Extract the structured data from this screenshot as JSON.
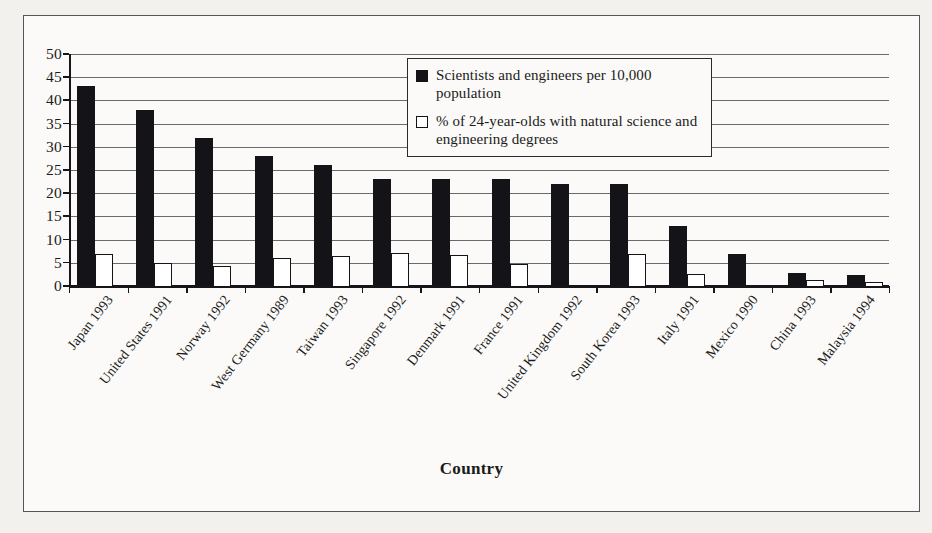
{
  "chart_data": {
    "type": "bar",
    "title": "",
    "xlabel": "Country",
    "ylabel": "",
    "ylim": [
      0,
      50
    ],
    "ytick_step": 5,
    "yticks": [
      50,
      45,
      40,
      35,
      30,
      25,
      20,
      15,
      10,
      5,
      0
    ],
    "grid": true,
    "legend_position": "top-right-inside",
    "categories": [
      "Japan 1993",
      "United States 1991",
      "Norway 1992",
      "West Germany 1989",
      "Taiwan 1993",
      "Singapore 1992",
      "Denmark 1991",
      "France 1991",
      "United Kingdom 1992",
      "South Korea 1993",
      "Italy 1991",
      "Mexico 1990",
      "China 1993",
      "Malaysia 1994"
    ],
    "series": [
      {
        "name": "Scientists and engineers per 10,000 population",
        "color": "#141418",
        "style": "filled",
        "values": [
          43,
          38,
          32,
          28,
          26,
          23,
          23,
          23,
          22,
          22,
          13,
          7,
          2.8,
          2.3
        ]
      },
      {
        "name": "% of 24-year-olds with natural science and engineering degrees",
        "color": "#ffffff",
        "style": "outlined",
        "values": [
          6.8,
          5,
          4.3,
          6,
          6.5,
          7.2,
          6.7,
          4.8,
          0,
          7,
          2.5,
          0,
          1.3,
          0.8
        ]
      }
    ]
  },
  "legend": {
    "entries": [
      {
        "swatch": "filled-square",
        "label": "Scientists and engineers per 10,000 population"
      },
      {
        "swatch": "outlined-square",
        "label": "% of 24-year-olds with natural science and engineering degrees"
      }
    ]
  },
  "axis": {
    "x_title": "Country"
  },
  "colors": {
    "series_dark": "#141418",
    "series_light": "#ffffff",
    "axis": "#15151a",
    "gridline": "#6a6a6a",
    "frame_border": "#55555a",
    "page_background": "#f3f1ee",
    "figure_background": "#fbfaf8"
  }
}
